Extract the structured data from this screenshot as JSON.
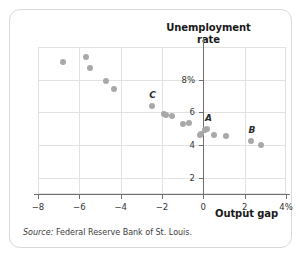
{
  "chart_data": {
    "type": "scatter",
    "title": "Unemployment rate",
    "title_line1": "Unemployment",
    "title_line2": "rate",
    "xlabel": "Output gap",
    "ylabel": "Unemployment rate",
    "xlim": [
      -8,
      4
    ],
    "ylim": [
      1,
      10
    ],
    "grid": true,
    "legend": "none",
    "xticks": [
      {
        "value": -8,
        "label": "−8"
      },
      {
        "value": -6,
        "label": "−6"
      },
      {
        "value": -4,
        "label": "−4"
      },
      {
        "value": -2,
        "label": "−2"
      },
      {
        "value": 0,
        "label": "0"
      },
      {
        "value": 2,
        "label": "2"
      },
      {
        "value": 4,
        "label": "4%"
      }
    ],
    "yticks": [
      {
        "value": 8,
        "label": "8%"
      },
      {
        "value": 6,
        "label": "6"
      },
      {
        "value": 4,
        "label": "4"
      },
      {
        "value": 2,
        "label": "2"
      }
    ],
    "point_color": "#a8a8a8",
    "points": [
      {
        "x": -6.8,
        "y": 9.1
      },
      {
        "x": -5.7,
        "y": 9.4
      },
      {
        "x": -5.5,
        "y": 8.7
      },
      {
        "x": -4.7,
        "y": 7.9
      },
      {
        "x": -4.3,
        "y": 7.4
      },
      {
        "x": -2.5,
        "y": 6.4,
        "label": "C"
      },
      {
        "x": -1.9,
        "y": 5.9
      },
      {
        "x": -1.8,
        "y": 5.85
      },
      {
        "x": -1.5,
        "y": 5.75
      },
      {
        "x": -1.0,
        "y": 5.3
      },
      {
        "x": -0.7,
        "y": 5.35
      },
      {
        "x": -0.15,
        "y": 4.6
      },
      {
        "x": -0.1,
        "y": 4.65
      },
      {
        "x": 0.1,
        "y": 4.9
      },
      {
        "x": 0.2,
        "y": 5.0,
        "label": "A"
      },
      {
        "x": 0.5,
        "y": 4.6
      },
      {
        "x": 1.1,
        "y": 4.55
      },
      {
        "x": 2.3,
        "y": 4.25,
        "label": "B"
      },
      {
        "x": 2.8,
        "y": 4.0
      }
    ]
  },
  "source": {
    "label": "Source:",
    "text": "Federal Reserve Bank of St. Louis."
  }
}
